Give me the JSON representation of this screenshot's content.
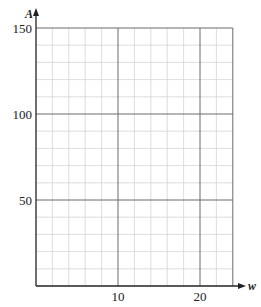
{
  "chart_data": {
    "type": "line",
    "title": "",
    "xlabel": "w",
    "ylabel": "A",
    "xlim": [
      0,
      24
    ],
    "ylim": [
      0,
      150
    ],
    "x_ticks": [
      10,
      20
    ],
    "y_ticks": [
      50,
      100,
      150
    ],
    "x_minor_step": 2,
    "y_minor_step": 10,
    "grid": true,
    "series": []
  },
  "colors": {
    "minor_grid": "#d4d4d4",
    "major_grid": "#6a6a6a",
    "axis": "#222222",
    "text": "#222222"
  },
  "labels": {
    "y_axis": "A",
    "x_axis": "w",
    "y_tick_50": "50",
    "y_tick_100": "100",
    "y_tick_150": "150",
    "x_tick_10": "10",
    "x_tick_20": "20"
  }
}
